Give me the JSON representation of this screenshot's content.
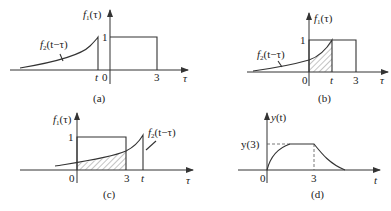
{
  "figure": {
    "panels": [
      {
        "id": "a",
        "caption": "(a)",
        "f1_label": "f1(τ)",
        "f2_label": "f2(t−τ)",
        "x_axis_label": "τ",
        "ticks": [
          "t",
          "0",
          "3"
        ],
        "rect_height_label": "1",
        "description": "f2(t−τ) entirely left of 0 (t<0), no overlap"
      },
      {
        "id": "b",
        "caption": "(b)",
        "f1_label": "f1(τ)",
        "f2_label": "f2(t−τ)",
        "x_axis_label": "τ",
        "ticks": [
          "0",
          "t",
          "3"
        ],
        "rect_height_label": "1",
        "description": "0<t<3, overlap region hatched from 0 to t"
      },
      {
        "id": "c",
        "caption": "(c)",
        "f1_label": "f1(τ)",
        "f2_label": "f2(t−τ)",
        "x_axis_label": "τ",
        "ticks": [
          "0",
          "3",
          "t"
        ],
        "rect_height_label": "1",
        "description": "t>3, overlap region hatched from 0 to 3"
      },
      {
        "id": "d",
        "caption": "(d)",
        "y_label": "y(t)",
        "x_axis_label": "t",
        "ticks": [
          "0",
          "3"
        ],
        "level_label": "y(3)",
        "description": "Convolution result y(t): rises, plateaus at y(3), decays after t=3"
      }
    ],
    "text": {
      "f1": "f",
      "f1_sub": "1",
      "f1_arg": "(τ)",
      "f2": "f",
      "f2_sub": "2",
      "f2_arg": "(t−τ)",
      "tau": "τ",
      "t": "t",
      "zero": "0",
      "three": "3",
      "one": "1",
      "y": "y",
      "y_arg": "(t)",
      "y3": "y(3)",
      "cap_a": "(a)",
      "cap_b": "(b)",
      "cap_c": "(c)",
      "cap_d": "(d)"
    },
    "colors": {
      "line": "#333333",
      "background": "#ffffff"
    }
  }
}
